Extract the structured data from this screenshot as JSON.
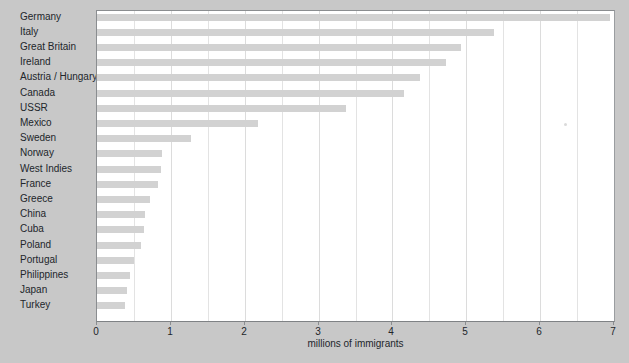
{
  "chart_data": {
    "type": "bar",
    "orientation": "horizontal",
    "title": "",
    "xlabel": "millions of immigrants",
    "ylabel": "",
    "xlim": [
      0,
      7
    ],
    "xticks": [
      0,
      1,
      2,
      3,
      4,
      5,
      6,
      7
    ],
    "xtick_labels": [
      "0",
      "1",
      "2",
      "3",
      "4",
      "5",
      "6",
      "7"
    ],
    "minor_gridlines": [
      0.5,
      1.5,
      2.5,
      3.5,
      4.5,
      5.5,
      6.5
    ],
    "grid": true,
    "legend": "none",
    "bar_color": "#d2d2d2",
    "plot_background": "#ffffff",
    "figure_background": "#c8c8c8",
    "categories": [
      "Germany",
      "Italy",
      "Great Britain",
      "Ireland",
      "Austria / Hungary",
      "Canada",
      "USSR",
      "Mexico",
      "Sweden",
      "Norway",
      "West Indies",
      "France",
      "Greece",
      "China",
      "Cuba",
      "Poland",
      "Portugal",
      "Philippines",
      "Japan",
      "Turkey"
    ],
    "values": [
      6.95,
      5.38,
      4.93,
      4.72,
      4.38,
      4.15,
      3.37,
      2.18,
      1.27,
      0.88,
      0.86,
      0.82,
      0.72,
      0.65,
      0.63,
      0.6,
      0.5,
      0.45,
      0.4,
      0.38
    ]
  }
}
